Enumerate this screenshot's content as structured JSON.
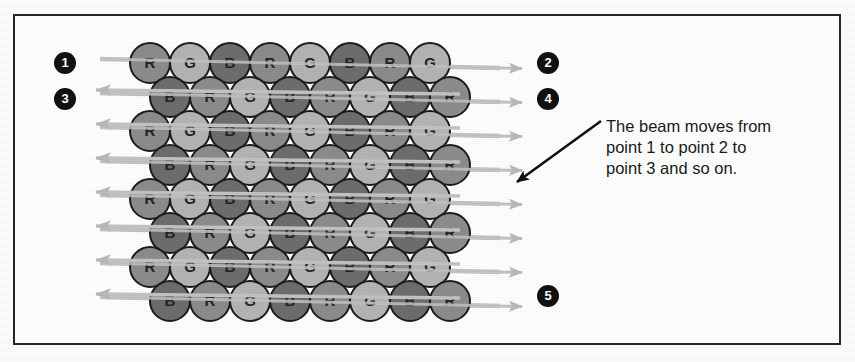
{
  "figure": {
    "border_color": "#272727",
    "background_color": "#ffffff"
  },
  "annotation": {
    "lines": [
      "The beam moves from",
      "point 1 to point 2 to",
      "point 3 and so on."
    ],
    "full_text": "The beam moves from point 1 to point 2 to point 3 and so on.",
    "leader_arrow": "black-diagonal-arrow"
  },
  "badges": [
    {
      "label": "1",
      "x": 54,
      "y": 52
    },
    {
      "label": "3",
      "x": 54,
      "y": 88
    },
    {
      "label": "2",
      "x": 537,
      "y": 52
    },
    {
      "label": "4",
      "x": 537,
      "y": 88
    },
    {
      "label": "5",
      "x": 537,
      "y": 285
    }
  ],
  "phosphor_grid": {
    "rows": 8,
    "columns": 8,
    "dot_diameter": 40,
    "row_spacing": 34,
    "column_spacing": 40,
    "odd_row_start_x": 150,
    "even_row_offset_x": 20,
    "first_row_y": 63,
    "row_patterns": [
      [
        "R",
        "G",
        "B",
        "R",
        "G",
        "B",
        "R",
        "G"
      ],
      [
        "B",
        "R",
        "G",
        "B",
        "R",
        "G",
        "B",
        "R"
      ],
      [
        "R",
        "G",
        "B",
        "R",
        "G",
        "B",
        "R",
        "G"
      ],
      [
        "B",
        "R",
        "G",
        "B",
        "R",
        "G",
        "B",
        "R"
      ],
      [
        "R",
        "G",
        "B",
        "R",
        "G",
        "B",
        "R",
        "G"
      ],
      [
        "B",
        "R",
        "G",
        "B",
        "R",
        "G",
        "B",
        "R"
      ],
      [
        "R",
        "G",
        "B",
        "R",
        "G",
        "B",
        "R",
        "G"
      ],
      [
        "B",
        "R",
        "G",
        "B",
        "R",
        "G",
        "B",
        "R"
      ]
    ],
    "colors": {
      "R": "#8c8c8c",
      "G": "#b4b4b4",
      "B": "#6d6d6d",
      "outline": "#1c1c1c",
      "letter": "#232323"
    },
    "legend": {
      "R": "red phosphor dot",
      "G": "green phosphor dot",
      "B": "blue phosphor dot"
    }
  },
  "beam": {
    "scan_line_color": "#c3c3c3",
    "scan_line_count": 8,
    "retrace_count": 7,
    "right_arrow_count": 8,
    "left_arrow_count": 7,
    "direction_right": "scan",
    "direction_left": "retrace"
  }
}
